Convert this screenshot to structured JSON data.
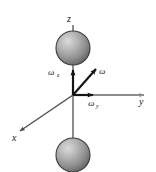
{
  "figure": {
    "background_color": "#ffffff",
    "axes": {
      "z": {
        "label": "z",
        "color": "#8c8c8c",
        "label_x": 67,
        "label_y": 22
      },
      "y": {
        "label": "y",
        "color": "#8c8c8c",
        "label_x": 139,
        "label_y": 105
      },
      "x": {
        "label": "x",
        "color": "#4d4d4d",
        "label_x": 12,
        "label_y": 141
      }
    },
    "vectors": [
      {
        "name": "omega-z",
        "label": "ω",
        "subscript": "z",
        "color": "#141414",
        "label_x": 48,
        "label_y": 75,
        "sub_x": 57,
        "sub_y": 77
      },
      {
        "name": "omega",
        "label": "ω",
        "subscript": "",
        "color": "#141414",
        "label_x": 99,
        "label_y": 74,
        "sub_x": 0,
        "sub_y": 0
      },
      {
        "name": "omega-y",
        "label": "ω",
        "subscript": "y",
        "color": "#141414",
        "label_x": 88,
        "label_y": 106,
        "sub_x": 96,
        "sub_y": 108
      }
    ],
    "spheres": [
      {
        "name": "upper-mass",
        "cx": 73,
        "cy": 48,
        "r": 17,
        "fill_light": "#d4d4d4",
        "fill_dark": "#6e6e6e",
        "outline": "#3a3a3a"
      },
      {
        "name": "lower-mass",
        "cx": 73,
        "cy": 155,
        "r": 17,
        "fill_light": "#d4d4d4",
        "fill_dark": "#6e6e6e",
        "outline": "#3a3a3a"
      }
    ],
    "origin": {
      "x": 73,
      "y": 95
    }
  }
}
